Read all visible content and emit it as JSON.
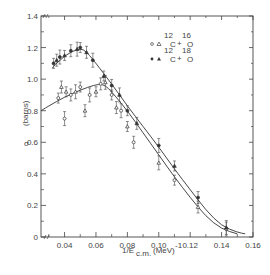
{
  "chart_data": {
    "type": "scatter",
    "title": "",
    "xlabel": "1/E_c.m. (MeV)^-1",
    "ylabel": "σ (barns)",
    "xlim": [
      0.025,
      0.16
    ],
    "ylim": [
      0,
      1.4
    ],
    "grid": false,
    "legend_position": "upper right",
    "x_ticks": [
      "0.04",
      "0.06",
      "0.08",
      "0.10",
      "0.12",
      "0.14",
      "0.16"
    ],
    "y_ticks": [
      "0",
      "0.2",
      "0.4",
      "0.6",
      "0.8",
      "1.0",
      "1.2",
      "1.4"
    ],
    "series": [
      {
        "name": "12C + 16O",
        "marker": "open circle & open triangle",
        "points": [
          [
            0.036,
            0.88
          ],
          [
            0.038,
            0.95
          ],
          [
            0.04,
            0.75
          ],
          [
            0.041,
            0.92
          ],
          [
            0.044,
            0.9
          ],
          [
            0.047,
            0.92
          ],
          [
            0.05,
            0.95
          ],
          [
            0.053,
            0.8
          ],
          [
            0.056,
            0.9
          ],
          [
            0.06,
            0.92
          ],
          [
            0.063,
            0.97
          ],
          [
            0.066,
            0.98
          ],
          [
            0.07,
            0.9
          ],
          [
            0.073,
            0.82
          ],
          [
            0.076,
            0.8
          ],
          [
            0.08,
            0.7
          ],
          [
            0.084,
            0.6
          ],
          [
            0.1,
            0.47
          ],
          [
            0.11,
            0.36
          ],
          [
            0.125,
            0.19
          ],
          [
            0.143,
            0.05
          ]
        ],
        "fit_curve": [
          [
            0.025,
            0.8
          ],
          [
            0.035,
            0.86
          ],
          [
            0.045,
            0.91
          ],
          [
            0.055,
            0.95
          ],
          [
            0.062,
            0.97
          ],
          [
            0.066,
            0.96
          ],
          [
            0.07,
            0.92
          ],
          [
            0.08,
            0.8
          ],
          [
            0.09,
            0.66
          ],
          [
            0.1,
            0.52
          ],
          [
            0.11,
            0.38
          ],
          [
            0.12,
            0.25
          ],
          [
            0.13,
            0.13
          ],
          [
            0.14,
            0.05
          ],
          [
            0.15,
            0.02
          ]
        ]
      },
      {
        "name": "12C + 18O",
        "marker": "filled circle & filled triangle",
        "points": [
          [
            0.033,
            1.1
          ],
          [
            0.035,
            1.12
          ],
          [
            0.037,
            1.14
          ],
          [
            0.04,
            1.15
          ],
          [
            0.044,
            1.18
          ],
          [
            0.048,
            1.19
          ],
          [
            0.05,
            1.2
          ],
          [
            0.054,
            1.17
          ],
          [
            0.058,
            1.12
          ],
          [
            0.065,
            1.02
          ],
          [
            0.07,
            0.96
          ],
          [
            0.075,
            0.9
          ],
          [
            0.08,
            0.8
          ],
          [
            0.086,
            0.72
          ],
          [
            0.1,
            0.58
          ],
          [
            0.11,
            0.45
          ],
          [
            0.125,
            0.25
          ],
          [
            0.143,
            0.06
          ]
        ],
        "fit_curve": [
          [
            0.032,
            1.07
          ],
          [
            0.04,
            1.15
          ],
          [
            0.048,
            1.19
          ],
          [
            0.052,
            1.19
          ],
          [
            0.056,
            1.15
          ],
          [
            0.06,
            1.1
          ],
          [
            0.07,
            0.97
          ],
          [
            0.08,
            0.83
          ],
          [
            0.09,
            0.7
          ],
          [
            0.1,
            0.57
          ],
          [
            0.11,
            0.43
          ],
          [
            0.12,
            0.3
          ],
          [
            0.13,
            0.17
          ],
          [
            0.14,
            0.07
          ],
          [
            0.15,
            0.03
          ],
          [
            0.155,
            0.02
          ]
        ]
      }
    ]
  },
  "legend": {
    "open": {
      "symbols": "o & ",
      "label_a_mass": "12",
      "label_a": "C",
      "plus": "+",
      "label_b_mass": "16",
      "label_b": "O"
    },
    "filled": {
      "symbols": "• ▲",
      "label_a_mass": "12",
      "label_a": "C",
      "plus": "+",
      "label_b_mass": "18",
      "label_b": "O"
    }
  },
  "axes": {
    "xlabel_main": "1/E",
    "xlabel_sub": "c.m.",
    "xlabel_unit": "(MeV)",
    "xlabel_exp": "-1",
    "ylabel_sym": "σ",
    "ylabel_unit": "(barns)"
  },
  "colors": {
    "ink": "#333333",
    "background": "#ffffff"
  }
}
